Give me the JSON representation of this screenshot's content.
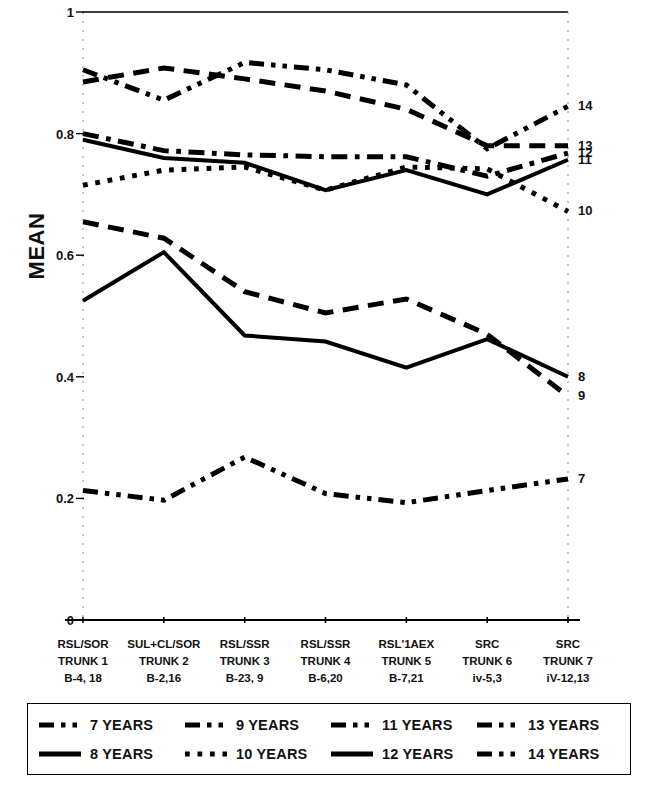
{
  "chart_data": {
    "type": "line",
    "title": "",
    "subtitle": "",
    "xlabel": "",
    "ylabel": "MEAN",
    "ylim": [
      0,
      1
    ],
    "yticks": [
      "0",
      "0.2",
      "0.4",
      "0.6",
      "0.8",
      "1"
    ],
    "ytick_values": [
      0,
      0.2,
      0.4,
      0.6,
      0.8,
      1
    ],
    "grid": false,
    "legend_position": "bottom-box",
    "categories": [
      "RSL/SOR TRUNK 1 B-4, 18",
      "SUL+CL/SOR TRUNK 2 B-2,16",
      "RSL/SSR TRUNK 3 B-23, 9",
      "RSL/SSR TRUNK 4 B-6,20",
      "RSL'1AEX TRUNK 5 B-7,21",
      "SRC TRUNK 6 iv-5,3",
      "SRC TRUNK 7 iV-12,13"
    ],
    "category_lines": [
      [
        "RSL/SOR",
        "TRUNK 1",
        "B-4, 18"
      ],
      [
        "SUL+CL/SOR",
        "TRUNK 2",
        "B-2,16"
      ],
      [
        "RSL/SSR",
        "TRUNK 3",
        "B-23, 9"
      ],
      [
        "RSL/SSR",
        "TRUNK 4",
        "B-6,20"
      ],
      [
        "RSL'1AEX",
        "TRUNK 5",
        "B-7,21"
      ],
      [
        "SRC",
        "TRUNK 6",
        "iv-5,3"
      ],
      [
        "SRC",
        "TRUNK 7",
        "iV-12,13"
      ]
    ],
    "series": [
      {
        "name": "7 YEARS",
        "end_label": "7",
        "dash": "dash-dot-dot",
        "width": 5,
        "values": [
          0.213,
          0.197,
          0.268,
          0.208,
          0.193,
          0.213,
          0.232
        ]
      },
      {
        "name": "8 YEARS",
        "end_label": "8",
        "dash": "solid",
        "width": 4,
        "values": [
          0.525,
          0.605,
          0.468,
          0.458,
          0.415,
          0.462,
          0.4
        ]
      },
      {
        "name": "9 YEARS",
        "end_label": "9",
        "dash": "dash",
        "width": 5,
        "values": [
          0.655,
          0.628,
          0.54,
          0.505,
          0.528,
          0.47,
          0.368
        ]
      },
      {
        "name": "10 YEARS",
        "end_label": "10",
        "dash": "dot",
        "width": 5,
        "values": [
          0.715,
          0.74,
          0.745,
          0.707,
          0.745,
          0.742,
          0.672
        ]
      },
      {
        "name": "11 YEARS",
        "end_label": "11",
        "dash": "solid",
        "width": 4,
        "values": [
          0.79,
          0.76,
          0.752,
          0.707,
          0.74,
          0.7,
          0.757
        ]
      },
      {
        "name": "12 YEARS",
        "end_label": "12",
        "dash": "dash-dot",
        "width": 5,
        "values": [
          0.8,
          0.772,
          0.765,
          0.762,
          0.762,
          0.73,
          0.768
        ]
      },
      {
        "name": "13 YEARS",
        "end_label": "13",
        "dash": "dash",
        "width": 5,
        "values": [
          0.885,
          0.908,
          0.89,
          0.87,
          0.84,
          0.78,
          0.78
        ]
      },
      {
        "name": "14 YEARS",
        "end_label": "14",
        "dash": "dash-dot-dot",
        "width": 5,
        "values": [
          0.905,
          0.855,
          0.917,
          0.905,
          0.88,
          0.775,
          0.845
        ]
      }
    ]
  },
  "legend": {
    "rows": [
      [
        {
          "label": "7 YEARS",
          "dash": "dash-dot-dot"
        },
        {
          "label": "9 YEARS",
          "dash": "dash-dot-dot"
        },
        {
          "label": "11 YEARS",
          "dash": "dash-dot-dot"
        },
        {
          "label": "13 YEARS",
          "dash": "dash-dot-dot"
        }
      ],
      [
        {
          "label": "8 YEARS",
          "dash": "solid"
        },
        {
          "label": "10 YEARS",
          "dash": "dot"
        },
        {
          "label": "12 YEARS",
          "dash": "solid"
        },
        {
          "label": "14 YEARS",
          "dash": "dash-dot-dot"
        }
      ]
    ]
  },
  "colors": {
    "ink": "#000000",
    "background": "#ffffff",
    "axis": "#000000",
    "tick_guide": "#999999"
  }
}
